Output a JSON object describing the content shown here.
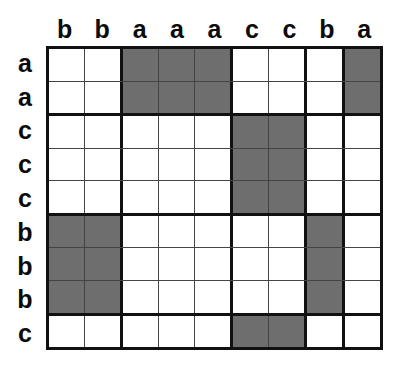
{
  "figure": {
    "name": "letter-match-grid",
    "rows": 9,
    "columns": 9,
    "shaded_color": "#6e6e6e",
    "empty_color": "#ffffff",
    "line_color": "#444444",
    "border_color": "#111111"
  },
  "column_headers": [
    "b",
    "b",
    "a",
    "a",
    "a",
    "c",
    "c",
    "b",
    "a"
  ],
  "row_headers": [
    "a",
    "a",
    "c",
    "c",
    "c",
    "b",
    "b",
    "b",
    "c"
  ],
  "group_dividers": {
    "after_columns": [
      2,
      5,
      7,
      8
    ],
    "after_rows": [
      2,
      5,
      8
    ]
  },
  "chart_data": {
    "type": "heatmap",
    "title": "",
    "xlabel": "",
    "ylabel": "",
    "categories": [
      "b",
      "b",
      "a",
      "a",
      "a",
      "c",
      "c",
      "b",
      "a"
    ],
    "row_categories": [
      "a",
      "a",
      "c",
      "c",
      "c",
      "b",
      "b",
      "b",
      "c"
    ],
    "legend": [
      "shaded = match",
      "blank = no match"
    ],
    "grid": true,
    "values": [
      [
        0,
        0,
        1,
        1,
        1,
        0,
        0,
        0,
        1
      ],
      [
        0,
        0,
        1,
        1,
        1,
        0,
        0,
        0,
        1
      ],
      [
        0,
        0,
        0,
        0,
        0,
        1,
        1,
        0,
        0
      ],
      [
        0,
        0,
        0,
        0,
        0,
        1,
        1,
        0,
        0
      ],
      [
        0,
        0,
        0,
        0,
        0,
        1,
        1,
        0,
        0
      ],
      [
        1,
        1,
        0,
        0,
        0,
        0,
        0,
        1,
        0
      ],
      [
        1,
        1,
        0,
        0,
        0,
        0,
        0,
        1,
        0
      ],
      [
        1,
        1,
        0,
        0,
        0,
        0,
        0,
        1,
        0
      ],
      [
        0,
        0,
        0,
        0,
        0,
        1,
        1,
        0,
        0
      ]
    ]
  }
}
